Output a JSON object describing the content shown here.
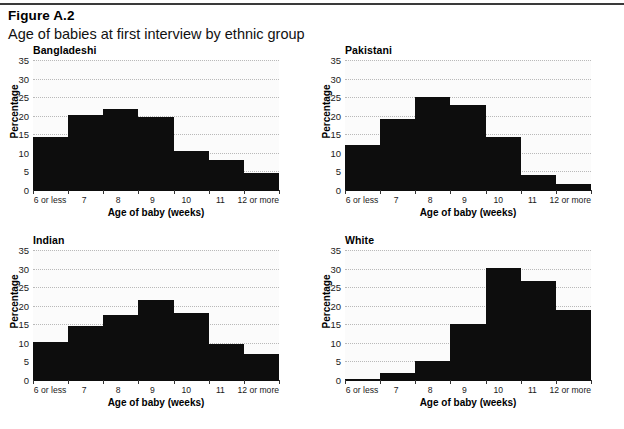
{
  "header": {
    "figure_number": "Figure A.2",
    "title": "Age of babies at first interview by ethnic group"
  },
  "chart_data": {
    "type": "bar",
    "title": "Age of babies at first interview by ethnic group",
    "figure_number": "Figure A.2",
    "xlabel": "Age of baby (weeks)",
    "ylabel": "Percentage",
    "categories": [
      "6 or less",
      "7",
      "8",
      "9",
      "10",
      "11",
      "12 or more"
    ],
    "ylim": [
      0,
      35
    ],
    "yticks": [
      0,
      5,
      10,
      15,
      20,
      25,
      30,
      35
    ],
    "grid": true,
    "legend": "none",
    "bar_color": "#0d0d0d",
    "panels": [
      {
        "label": "Bangladeshi",
        "values": [
          14.2,
          20.2,
          21.8,
          19.6,
          10.4,
          8.0,
          4.5
        ]
      },
      {
        "label": "Pakistani",
        "values": [
          12.0,
          19.0,
          25.0,
          22.9,
          14.4,
          4.0,
          1.5
        ]
      },
      {
        "label": "Indian",
        "values": [
          10.2,
          14.6,
          17.5,
          21.6,
          18.0,
          9.6,
          7.1
        ]
      },
      {
        "label": "White",
        "values": [
          0.4,
          2.0,
          5.2,
          15.0,
          30.2,
          26.7,
          18.9
        ]
      }
    ]
  }
}
